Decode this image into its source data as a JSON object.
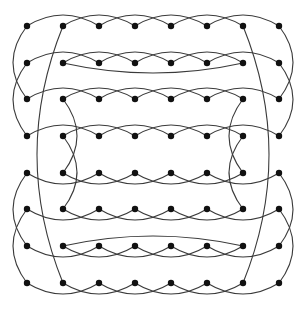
{
  "diagram": {
    "type": "graph",
    "node_color": "#111111",
    "edge_color": "#3a3a3a",
    "node_radius": 3.2,
    "columns_x": [
      27,
      63,
      99,
      135,
      171,
      207,
      243,
      279
    ],
    "rows_y": [
      26,
      63,
      99,
      136,
      173,
      209,
      246,
      283
    ],
    "row_skip_arcs": [
      {
        "row": 0,
        "side": "up"
      },
      {
        "row": 1,
        "side": "up"
      },
      {
        "row": 2,
        "side": "up"
      },
      {
        "row": 3,
        "side": "up"
      },
      {
        "row": 4,
        "side": "down"
      },
      {
        "row": 5,
        "side": "down"
      },
      {
        "row": 6,
        "side": "down"
      },
      {
        "row": 7,
        "side": "down"
      }
    ],
    "long_row_arcs": [
      {
        "row": 1,
        "from_col": 1,
        "to_col": 6,
        "side": "down",
        "bulge": 10
      },
      {
        "row": 6,
        "from_col": 1,
        "to_col": 6,
        "side": "up",
        "bulge": 10
      }
    ],
    "column_arcs": [
      {
        "col": 0,
        "from_row": 0,
        "to_row": 2,
        "bulge": -14
      },
      {
        "col": 0,
        "from_row": 1,
        "to_row": 3,
        "bulge": -14
      },
      {
        "col": 0,
        "from_row": 4,
        "to_row": 6,
        "bulge": -14
      },
      {
        "col": 0,
        "from_row": 5,
        "to_row": 7,
        "bulge": -14
      },
      {
        "col": 7,
        "from_row": 0,
        "to_row": 2,
        "bulge": 14
      },
      {
        "col": 7,
        "from_row": 1,
        "to_row": 3,
        "bulge": 14
      },
      {
        "col": 7,
        "from_row": 4,
        "to_row": 6,
        "bulge": 14
      },
      {
        "col": 7,
        "from_row": 5,
        "to_row": 7,
        "bulge": 14
      },
      {
        "col": 1,
        "from_row": 0,
        "to_row": 7,
        "bulge": -26
      },
      {
        "col": 6,
        "from_row": 0,
        "to_row": 7,
        "bulge": 26
      },
      {
        "col": 1,
        "from_row": 2,
        "to_row": 4,
        "bulge": 14
      },
      {
        "col": 1,
        "from_row": 3,
        "to_row": 5,
        "bulge": 14
      },
      {
        "col": 6,
        "from_row": 2,
        "to_row": 4,
        "bulge": -14
      },
      {
        "col": 6,
        "from_row": 3,
        "to_row": 5,
        "bulge": -14
      }
    ]
  }
}
